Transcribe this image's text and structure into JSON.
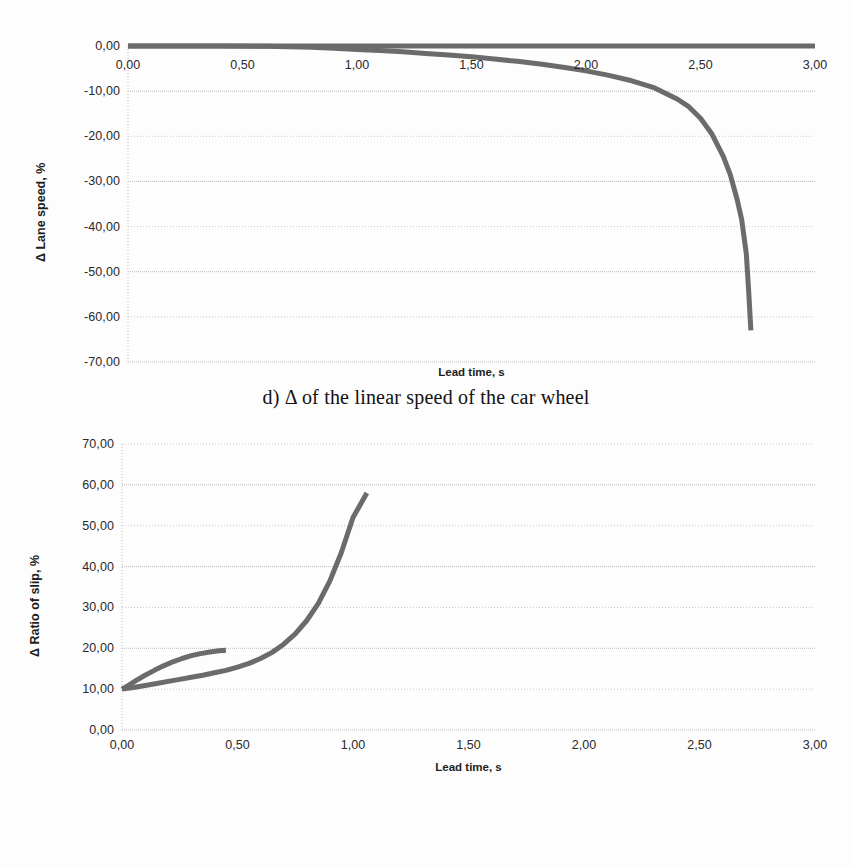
{
  "document": {
    "figures": [
      {
        "id": "d",
        "caption": "d) Δ of the linear speed of the car wheel"
      },
      {
        "id": "e",
        "caption": "e) Δ coefficient of relative slip"
      }
    ]
  },
  "chart_data": [
    {
      "type": "line",
      "title": "",
      "xlabel": "Lead time, s",
      "ylabel": "Δ Lane speed, %",
      "xlim": [
        0.0,
        3.0
      ],
      "ylim": [
        -70.0,
        0.0
      ],
      "grid": true,
      "legend": false,
      "line_color": "#6b6b6b",
      "xticks": [
        "0,00",
        "0,50",
        "1,00",
        "1,50",
        "2,00",
        "2,50",
        "3,00"
      ],
      "xtick_values": [
        0.0,
        0.5,
        1.0,
        1.5,
        2.0,
        2.5,
        3.0
      ],
      "yticks": [
        "0,00",
        "-10,00",
        "-20,00",
        "-30,00",
        "-40,00",
        "-50,00",
        "-60,00",
        "-70,00"
      ],
      "ytick_values": [
        0.0,
        -10.0,
        -20.0,
        -30.0,
        -40.0,
        -50.0,
        -60.0,
        -70.0
      ],
      "series": [
        {
          "name": "baseline",
          "x": [
            0.0,
            0.25,
            0.5,
            0.75,
            1.0,
            1.25,
            1.5,
            1.75,
            2.0,
            2.25,
            2.5,
            2.75,
            3.0
          ],
          "values": [
            0.0,
            0.0,
            0.0,
            0.0,
            0.0,
            0.0,
            0.0,
            0.0,
            0.0,
            0.0,
            0.0,
            0.0,
            0.0
          ]
        },
        {
          "name": "delta-linear-speed",
          "x": [
            0.0,
            0.2,
            0.4,
            0.6,
            0.7,
            0.8,
            0.9,
            1.0,
            1.1,
            1.2,
            1.3,
            1.4,
            1.5,
            1.6,
            1.7,
            1.8,
            1.9,
            2.0,
            2.1,
            2.2,
            2.3,
            2.4,
            2.45,
            2.5,
            2.55,
            2.6,
            2.63,
            2.66,
            2.68,
            2.7,
            2.71,
            2.72
          ],
          "values": [
            0.0,
            0.0,
            0.0,
            -0.05,
            -0.15,
            -0.3,
            -0.5,
            -0.75,
            -1.0,
            -1.3,
            -1.65,
            -2.0,
            -2.4,
            -2.9,
            -3.4,
            -4.0,
            -4.7,
            -5.5,
            -6.5,
            -7.7,
            -9.3,
            -11.8,
            -13.5,
            -16.0,
            -19.5,
            -24.5,
            -28.5,
            -34.0,
            -38.5,
            -46.0,
            -54.0,
            -63.0
          ]
        }
      ]
    },
    {
      "type": "line",
      "title": "",
      "xlabel": "Lead time, s",
      "ylabel": "Δ Ratio of slip, %",
      "xlim": [
        0.0,
        3.0
      ],
      "ylim": [
        0.0,
        70.0
      ],
      "grid": true,
      "legend": false,
      "line_color": "#6b6b6b",
      "xticks": [
        "0,00",
        "0,50",
        "1,00",
        "1,50",
        "2,00",
        "2,50",
        "3,00"
      ],
      "xtick_values": [
        0.0,
        0.5,
        1.0,
        1.5,
        2.0,
        2.5,
        3.0
      ],
      "yticks": [
        "70,00",
        "60,00",
        "50,00",
        "40,00",
        "30,00",
        "20,00",
        "10,00",
        "0,00"
      ],
      "ytick_values": [
        70.0,
        60.0,
        50.0,
        40.0,
        30.0,
        20.0,
        10.0,
        0.0
      ],
      "series": [
        {
          "name": "upper-branch",
          "x": [
            0.0,
            0.03,
            0.06,
            0.1,
            0.14,
            0.18,
            0.22,
            0.26,
            0.3,
            0.34,
            0.38,
            0.42,
            0.45
          ],
          "values": [
            10.0,
            11.0,
            12.1,
            13.4,
            14.6,
            15.7,
            16.7,
            17.5,
            18.2,
            18.7,
            19.1,
            19.4,
            19.5
          ]
        },
        {
          "name": "lower-branch",
          "x": [
            0.0,
            0.05,
            0.1,
            0.15,
            0.2,
            0.25,
            0.3,
            0.35,
            0.4,
            0.45,
            0.5,
            0.55,
            0.6,
            0.65,
            0.7,
            0.75,
            0.8,
            0.85,
            0.9,
            0.95,
            1.0,
            1.03,
            1.06
          ],
          "values": [
            10.0,
            10.4,
            10.9,
            11.4,
            11.9,
            12.4,
            12.9,
            13.4,
            14.0,
            14.6,
            15.4,
            16.3,
            17.5,
            19.0,
            21.0,
            23.5,
            26.8,
            31.0,
            36.5,
            43.5,
            52.0,
            55.0,
            58.0
          ]
        }
      ]
    }
  ]
}
